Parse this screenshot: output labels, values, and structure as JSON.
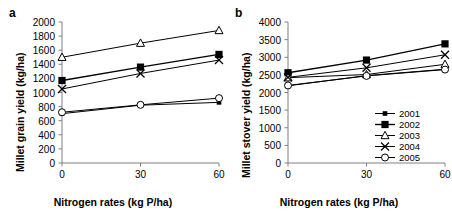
{
  "figure": {
    "panels": [
      {
        "id": "a",
        "label": "a",
        "ylabel": "Millet grain yield (kg/ha)",
        "xlabel": "Nitrogen rates (kg P/ha)",
        "yticks": [
          "0",
          "200",
          "400",
          "600",
          "800",
          "1000",
          "1200",
          "1400",
          "1600",
          "1800",
          "2000"
        ],
        "xticks": [
          "0",
          "30",
          "60"
        ]
      },
      {
        "id": "b",
        "label": "b",
        "ylabel": "Millet stover yield (kg/ha)",
        "xlabel": "Nitrogen rates (kg P/ha)",
        "yticks": [
          "0",
          "500",
          "1000",
          "1500",
          "2000",
          "2500",
          "3000",
          "3500",
          "4000"
        ],
        "xticks": [
          "0",
          "30",
          "60"
        ]
      }
    ],
    "legend": {
      "position": "inside-right-middle-panel-b",
      "entries": [
        {
          "label": "2001",
          "marker": "small-filled-square"
        },
        {
          "label": "2002",
          "marker": "filled-square"
        },
        {
          "label": "2003",
          "marker": "open-triangle"
        },
        {
          "label": "2004",
          "marker": "cross-x"
        },
        {
          "label": "2005",
          "marker": "open-circle"
        }
      ]
    }
  },
  "chart_data": [
    {
      "type": "line",
      "panel": "a",
      "title": "",
      "xlabel": "Nitrogen rates (kg P/ha)",
      "ylabel": "Millet grain yield (kg/ha)",
      "x": [
        0,
        30,
        60
      ],
      "xlim": [
        0,
        60
      ],
      "ylim": [
        0,
        2000
      ],
      "ytick_step": 200,
      "grid": false,
      "series": [
        {
          "name": "2001",
          "marker": "small-filled-square",
          "values": [
            700,
            820,
            860
          ]
        },
        {
          "name": "2002",
          "marker": "filled-square",
          "values": [
            1170,
            1360,
            1540
          ]
        },
        {
          "name": "2003",
          "marker": "open-triangle",
          "values": [
            1500,
            1700,
            1880
          ]
        },
        {
          "name": "2004",
          "marker": "cross-x",
          "values": [
            1050,
            1270,
            1460
          ]
        },
        {
          "name": "2005",
          "marker": "open-circle",
          "values": [
            720,
            825,
            920
          ]
        }
      ]
    },
    {
      "type": "line",
      "panel": "b",
      "title": "",
      "xlabel": "Nitrogen rates (kg P/ha)",
      "ylabel": "Millet stover yield (kg/ha)",
      "x": [
        0,
        30,
        60
      ],
      "xlim": [
        0,
        60
      ],
      "ylim": [
        0,
        4000
      ],
      "ytick_step": 500,
      "grid": false,
      "series": [
        {
          "name": "2001",
          "marker": "small-filled-square",
          "values": [
            2190,
            2480,
            2660
          ]
        },
        {
          "name": "2002",
          "marker": "filled-square",
          "values": [
            2560,
            2920,
            3380
          ]
        },
        {
          "name": "2003",
          "marker": "open-triangle",
          "values": [
            2420,
            2510,
            2800
          ]
        },
        {
          "name": "2004",
          "marker": "cross-x",
          "values": [
            2430,
            2700,
            3070
          ]
        },
        {
          "name": "2005",
          "marker": "open-circle",
          "values": [
            2200,
            2470,
            2650
          ]
        }
      ]
    }
  ],
  "colors": {
    "ink": "#000000",
    "axis": "#808080",
    "background": "#ffffff"
  }
}
